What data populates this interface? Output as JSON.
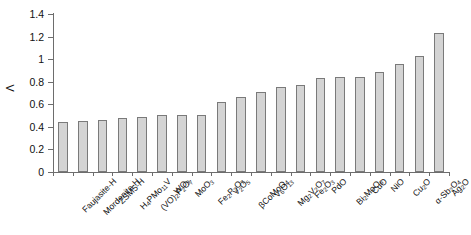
{
  "chart_data": {
    "type": "bar",
    "title": "",
    "xlabel": "",
    "ylabel": "Λ",
    "ylim": [
      0,
      1.4
    ],
    "ytick_labels": [
      "0",
      "0.2",
      "0.4",
      "0.6",
      "0.8",
      "1",
      "1.2",
      "1.4"
    ],
    "ytick_values": [
      0,
      0.2,
      0.4,
      0.6,
      0.8,
      1.0,
      1.2,
      1.4
    ],
    "grid": false,
    "legend": null,
    "categories": [
      "Faujasite-H",
      "Mordenite-H",
      "ZSM5-H",
      "H₄PMo₁₁V",
      "(VO)₂P₂O₇",
      "WO₃",
      "MoO₃",
      "Fe₂P₂O₇",
      "V₂O₅",
      "βCoMoO₄",
      "V₆O₁₃",
      "Mg₂V₂O₇",
      "Fe₂O₃",
      "PdO",
      "Bi₂MoO₆",
      "CuO",
      "NiO",
      "Cu₂O",
      "α-Sb₂O₄",
      "Ag₂O"
    ],
    "categories_html": [
      "Faujasite-H",
      "Mordenite-H",
      "ZSM5-H",
      "H<sub>4</sub>PMo<sub>11</sub>V",
      "(VO)<sub>2</sub>P<sub>2</sub>O<sub>7</sub>",
      "WO<sub>3</sub>",
      "MoO<sub>3</sub>",
      "Fe<sub>2</sub>P<sub>2</sub>O<sub>7</sub>",
      "V<sub>2</sub>O<sub>5</sub>",
      "&beta;CoMoO<sub>4</sub>",
      "V<sub>6</sub>O<sub>13</sub>",
      "Mg<sub>2</sub>V<sub>2</sub>O<sub>7</sub>",
      "Fe<sub>2</sub>O<sub>3</sub>",
      "PdO",
      "Bi<sub>2</sub>MoO<sub>6</sub>",
      "CuO",
      "NiO",
      "Cu<sub>2</sub>O",
      "&alpha;-Sb<sub>2</sub>O<sub>4</sub>",
      "Ag<sub>2</sub>O"
    ],
    "values": [
      0.44,
      0.455,
      0.46,
      0.475,
      0.485,
      0.505,
      0.505,
      0.505,
      0.62,
      0.665,
      0.71,
      0.755,
      0.775,
      0.835,
      0.845,
      0.845,
      0.89,
      0.96,
      1.03,
      1.23
    ],
    "bar_fill_color": "#d4d4d4",
    "bar_edge_color": "#7a7a7a",
    "axis_color": "#6d6d6d",
    "background_color": "#ffffff"
  }
}
